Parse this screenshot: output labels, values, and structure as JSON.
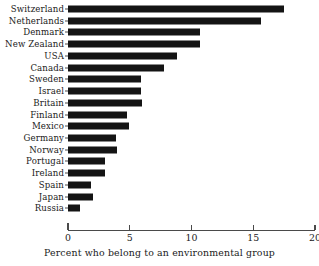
{
  "chart_data": {
    "type": "bar",
    "orientation": "horizontal",
    "title": "",
    "xlabel": "Percent who belong to an environmental group",
    "ylabel": "",
    "xlim": [
      0,
      20
    ],
    "xticks": [
      0,
      5,
      10,
      15,
      20
    ],
    "xtick_labels": [
      "0",
      "5",
      "10",
      "15",
      "20"
    ],
    "grid": false,
    "legend": null,
    "bar_color": "#141414",
    "background_color": "#ffffff",
    "categories": [
      "Switzerland",
      "Netherlands",
      "Denmark",
      "New Zealand",
      "USA",
      "Canada",
      "Sweden",
      "Israel",
      "Britain",
      "Finland",
      "Mexico",
      "Germany",
      "Norway",
      "Portugal",
      "Ireland",
      "Spain",
      "Japan",
      "Russia"
    ],
    "values": [
      17.5,
      15.6,
      10.7,
      10.7,
      8.8,
      7.8,
      5.9,
      5.9,
      6.0,
      4.8,
      4.9,
      3.9,
      4.0,
      3.0,
      3.0,
      1.9,
      2.0,
      1.0
    ]
  },
  "axis": {
    "title": "Percent who belong to an environmental group"
  }
}
